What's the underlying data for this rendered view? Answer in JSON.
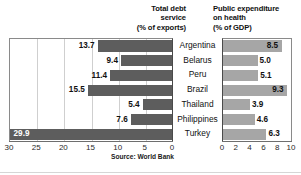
{
  "chart_data": [
    {
      "type": "bar",
      "orientation": "horizontal",
      "direction": "right-to-left",
      "title": "Total debt service (% of exports)",
      "title_lines": [
        "Total debt",
        "service",
        "(% of exports)"
      ],
      "xlabel": "",
      "ylabel": "",
      "categories": [
        "Argentina",
        "Belarus",
        "Peru",
        "Brazil",
        "Thailand",
        "Philippines",
        "Turkey"
      ],
      "values": [
        13.7,
        9.4,
        11.4,
        15.5,
        5.4,
        7.6,
        29.9
      ],
      "value_labels": [
        "13.7",
        "9.4",
        "11.4",
        "15.5",
        "5.4",
        "7.6",
        "29.9"
      ],
      "xlim": [
        0,
        30
      ],
      "ticks": [
        "30",
        "25",
        "20",
        "15",
        "10",
        "5",
        "0"
      ],
      "tick_values": [
        30,
        25,
        20,
        15,
        10,
        5,
        0
      ],
      "grid": true,
      "bar_color": "#5d5d5d",
      "label_inside": [
        false,
        false,
        false,
        false,
        false,
        false,
        true
      ]
    },
    {
      "type": "bar",
      "orientation": "horizontal",
      "direction": "left-to-right",
      "title": "Public expenditure on health (% of GDP)",
      "title_lines": [
        "Public expenditure",
        "on health",
        "(% of GDP)"
      ],
      "xlabel": "",
      "ylabel": "",
      "categories": [
        "Argentina",
        "Belarus",
        "Peru",
        "Brazil",
        "Thailand",
        "Philippines",
        "Turkey"
      ],
      "values": [
        8.5,
        5.0,
        5.1,
        9.3,
        3.9,
        4.6,
        6.3
      ],
      "value_labels": [
        "8.5",
        "5.0",
        "5.1",
        "9.3",
        "3.9",
        "4.6",
        "6.3"
      ],
      "xlim": [
        0,
        10
      ],
      "ticks": [
        "0",
        "2",
        "4",
        "6",
        "8",
        "10"
      ],
      "tick_values": [
        0,
        2,
        4,
        6,
        8,
        10
      ],
      "grid": false,
      "bar_color": "#a6a6a6",
      "label_inside": [
        true,
        false,
        false,
        true,
        false,
        false,
        false
      ]
    }
  ],
  "titles": {
    "left_line1": "Total debt",
    "left_line2": "service",
    "left_line3": "(% of exports)",
    "right_line1": "Public expenditure",
    "right_line2": "on health",
    "right_line3": "(% of GDP)"
  },
  "countries": [
    "Argentina",
    "Belarus",
    "Peru",
    "Brazil",
    "Thailand",
    "Philippines",
    "Turkey"
  ],
  "left_values": [
    "13.7",
    "9.4",
    "11.4",
    "15.5",
    "5.4",
    "7.6",
    "29.9"
  ],
  "right_values": [
    "8.5",
    "5.0",
    "5.1",
    "9.3",
    "3.9",
    "4.6",
    "6.3"
  ],
  "left_ticks": [
    "30",
    "25",
    "20",
    "15",
    "10",
    "5",
    "0"
  ],
  "right_ticks": [
    "0",
    "2",
    "4",
    "6",
    "8",
    "10"
  ],
  "source": "Source: World Bank",
  "colors": {
    "left_bar": "#5d5d5d",
    "right_bar": "#a6a6a6",
    "grid": "#cfcfcf",
    "axis": "#6e6e6e",
    "text": "#111111",
    "background": "#ffffff"
  }
}
